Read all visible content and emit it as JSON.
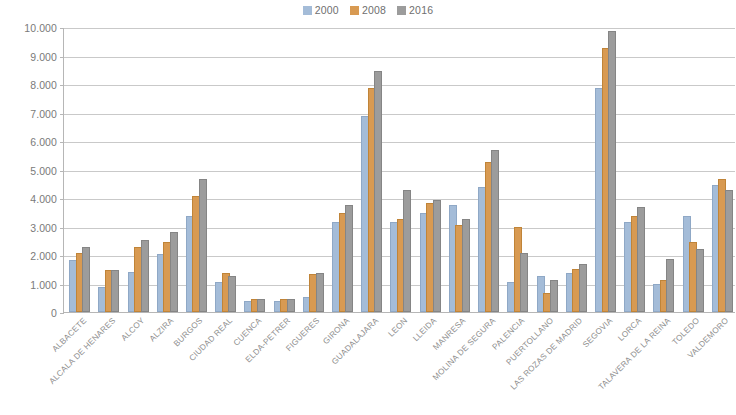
{
  "chart_data": {
    "type": "bar",
    "title": "",
    "subtitle": "",
    "xlabel": "",
    "ylabel": "",
    "ylim": [
      0,
      10000
    ],
    "ytick_labels": [
      "0",
      "1.000",
      "2.000",
      "3.000",
      "4.000",
      "5.000",
      "6.000",
      "7.000",
      "8.000",
      "9.000",
      "10.000"
    ],
    "ytick_values": [
      0,
      1000,
      2000,
      3000,
      4000,
      5000,
      6000,
      7000,
      8000,
      9000,
      10000
    ],
    "grid": true,
    "legend_position": "top-center",
    "categories": [
      "ALBACETE",
      "ALCALA DE HENARES",
      "ALCOY",
      "ALZIRA",
      "BURGOS",
      "CIUDAD REAL",
      "CUENCA",
      "ELDA-PETRER",
      "FIGUERES",
      "GIRONA",
      "GUADALAJARA",
      "LEON",
      "LLEIDA",
      "MANRESA",
      "MOLINA DE SEGURA",
      "PALENCIA",
      "PUERTOLLANO",
      "LAS ROZAS DE MADRID",
      "SEGOVIA",
      "LORCA",
      "TALAVERA DE LA REINA",
      "TOLEDO",
      "VALDEMORO"
    ],
    "series": [
      {
        "name": "2000",
        "color": "#a4bcd8",
        "values": [
          1750,
          800,
          1350,
          1950,
          3300,
          1000,
          300,
          330,
          450,
          3100,
          6800,
          3100,
          3400,
          3700,
          4300,
          1000,
          1200,
          1300,
          7800,
          3100,
          900,
          3300,
          4400
        ]
      },
      {
        "name": "2008",
        "color": "#d89a52",
        "values": [
          2000,
          1400,
          2200,
          2400,
          4000,
          1300,
          400,
          400,
          1250,
          3400,
          7800,
          3200,
          3750,
          3000,
          5200,
          2900,
          600,
          1450,
          9200,
          3300,
          1050,
          2400,
          4600
        ]
      },
      {
        "name": "2016",
        "color": "#9c9c9c",
        "values": [
          2200,
          1400,
          2450,
          2750,
          4600,
          1200,
          400,
          400,
          1300,
          3700,
          8400,
          4200,
          3850,
          3200,
          5600,
          2000,
          1050,
          1600,
          9800,
          3600,
          1800,
          2150,
          4200
        ]
      }
    ]
  },
  "legend": {
    "items": [
      {
        "label": "2000",
        "color": "#a4bcd8"
      },
      {
        "label": "2008",
        "color": "#d89a52"
      },
      {
        "label": "2016",
        "color": "#9c9c9c"
      }
    ]
  }
}
